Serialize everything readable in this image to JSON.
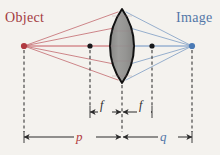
{
  "figure": {
    "type": "optics-ray-diagram",
    "background_color": "#f4f2ee",
    "labels": {
      "object": "Object",
      "image": "Image",
      "focal_left": "f",
      "focal_right": "f",
      "object_distance": "p",
      "image_distance": "q"
    },
    "colors": {
      "object_color": "#a33a3f",
      "image_color": "#5377a8",
      "object_ray": "#c36a6e",
      "image_ray": "#7d9dc4",
      "axis_ray_object": "#c0484e",
      "axis_ray_image": "#5b87bd",
      "lens_fill": "#8d8d8b",
      "lens_stroke": "#111111",
      "dimension_line": "#2b2b2b",
      "dashed_line": "#3a3a3a",
      "p_label": "#b23c41",
      "q_label": "#5377a8"
    },
    "points": {
      "object_point": {
        "x": 24,
        "y": 46,
        "name": "object-point"
      },
      "focal_point_left": {
        "x": 90,
        "y": 46,
        "name": "left-focal-point"
      },
      "lens_center": {
        "x": 122,
        "y": 46,
        "name": "lens-center"
      },
      "focal_point_right": {
        "x": 152,
        "y": 46,
        "name": "right-focal-point"
      },
      "image_point": {
        "x": 192,
        "y": 46,
        "name": "image-point"
      }
    },
    "lens": {
      "center_x": 122,
      "top_y": 10,
      "bottom_y": 82,
      "half_width": 10,
      "shape": "biconvex"
    },
    "object_rays": [
      {
        "to_x": 118,
        "to_y": 12
      },
      {
        "to_x": 114,
        "to_y": 28
      },
      {
        "to_x": 112,
        "to_y": 46
      },
      {
        "to_x": 114,
        "to_y": 64
      },
      {
        "to_x": 118,
        "to_y": 80
      }
    ],
    "image_rays": [
      {
        "from_x": 126,
        "from_y": 12
      },
      {
        "from_x": 130,
        "from_y": 28
      },
      {
        "from_x": 132,
        "from_y": 46
      },
      {
        "from_x": 130,
        "from_y": 64
      },
      {
        "from_x": 126,
        "from_y": 80
      }
    ],
    "dashed_verticals": [
      {
        "x": 24,
        "y1": 48,
        "y2": 140,
        "name": "object-dashed-line"
      },
      {
        "x": 90,
        "y1": 48,
        "y2": 114,
        "name": "left-focal-dashed-line"
      },
      {
        "x": 122,
        "y1": 84,
        "y2": 140,
        "name": "lens-axis-dashed-line"
      },
      {
        "x": 152,
        "y1": 48,
        "y2": 114,
        "name": "right-focal-dashed-line"
      },
      {
        "x": 192,
        "y1": 48,
        "y2": 140,
        "name": "image-dashed-line"
      }
    ],
    "dimensions": [
      {
        "name": "focal-left-dimension",
        "y": 112,
        "x1": 90,
        "x2": 122,
        "label": "f"
      },
      {
        "name": "focal-right-dimension",
        "y": 112,
        "x1": 122,
        "x2": 152,
        "label": "f"
      },
      {
        "name": "object-distance-dimension",
        "y": 137,
        "x1": 24,
        "x2": 122,
        "label": "p"
      },
      {
        "name": "image-distance-dimension",
        "y": 137,
        "x1": 122,
        "x2": 192,
        "label": "q"
      }
    ]
  }
}
